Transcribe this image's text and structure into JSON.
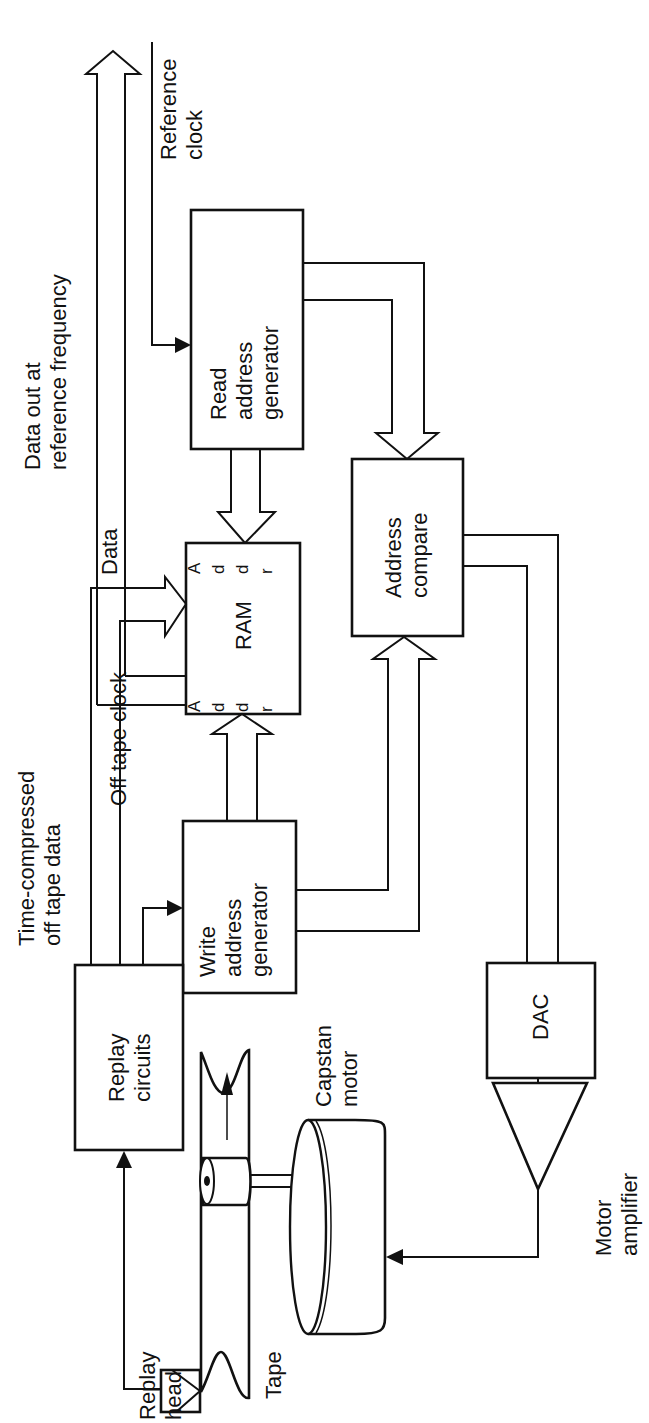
{
  "diagram": {
    "orientation": "rotated-90-ccw",
    "blocks": {
      "read_address_generator": {
        "lines": [
          "Read",
          "address",
          "generator"
        ]
      },
      "ram": {
        "label": "RAM",
        "port_left": [
          "A",
          "d",
          "d",
          "r"
        ],
        "port_right": [
          "A",
          "d",
          "d",
          "r"
        ]
      },
      "address_compare": {
        "lines": [
          "Address",
          "compare"
        ]
      },
      "write_address_generator": {
        "lines": [
          "Write",
          "address",
          "generator"
        ]
      },
      "dac": {
        "label": "DAC"
      },
      "replay_circuits": {
        "lines": [
          "Replay",
          "circuits"
        ]
      }
    },
    "labels": {
      "reference_clock": [
        "Reference",
        "clock"
      ],
      "data_out": [
        "Data out at",
        "reference frequency"
      ],
      "data": "Data",
      "off_tape_clock": "Off tape clock",
      "time_compressed": [
        "Time-compressed",
        "off tape data"
      ],
      "capstan_motor": [
        "Capstan",
        "motor"
      ],
      "motor_amplifier": [
        "Motor",
        "amplifier"
      ],
      "tape": "Tape",
      "replay_head": [
        "Replay",
        "head"
      ]
    }
  }
}
